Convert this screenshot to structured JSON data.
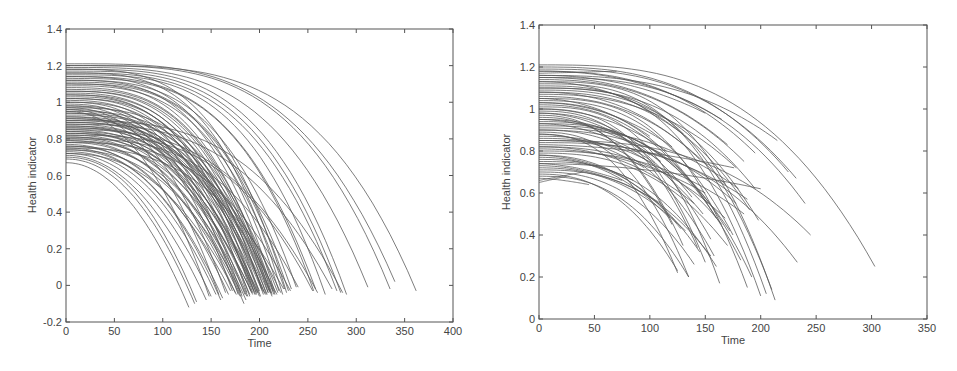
{
  "chart_data": [
    {
      "type": "line",
      "title": "",
      "xlabel": "Time",
      "ylabel": "Health indicator",
      "xlim": [
        0,
        400
      ],
      "ylim": [
        -0.2,
        1.4
      ],
      "xticks": [
        0,
        50,
        100,
        150,
        200,
        250,
        300,
        350,
        400
      ],
      "yticks": [
        -0.2,
        0,
        0.2,
        0.4,
        0.6,
        0.8,
        1,
        1.2,
        1.4
      ],
      "xtick_labels": [
        "0",
        "50",
        "100",
        "150",
        "200",
        "250",
        "300",
        "350",
        "400"
      ],
      "ytick_labels": [
        "-0.2",
        "0",
        "0.2",
        "0.4",
        "0.6",
        "0.8",
        "1",
        "1.2",
        "1.4"
      ],
      "grid": false,
      "legend": null,
      "description": "Many degradation trajectories (health indicator vs time), each starting between ~0.67 and ~1.21 at t=0 and decaying nonlinearly to ~0 to -0.12, failure times ranging ~125 to ~362",
      "curve_model": "h(t) = h0 - (h0 - hEnd) * (t / tEnd)^p",
      "series_params_columns": [
        "h0",
        "tEnd",
        "hEnd",
        "p"
      ],
      "series_params": [
        [
          0.67,
          127,
          -0.12,
          2.0
        ],
        [
          0.69,
          133,
          -0.1,
          2.1
        ],
        [
          0.7,
          135,
          -0.09,
          2.2
        ],
        [
          0.71,
          145,
          -0.08,
          2.1
        ],
        [
          0.72,
          150,
          -0.06,
          2.2
        ],
        [
          0.73,
          155,
          -0.05,
          2.3
        ],
        [
          0.74,
          160,
          -0.08,
          2.4
        ],
        [
          0.75,
          162,
          -0.07,
          2.3
        ],
        [
          0.76,
          168,
          -0.05,
          2.4
        ],
        [
          0.77,
          170,
          -0.03,
          2.2
        ],
        [
          0.78,
          175,
          -0.04,
          2.5
        ],
        [
          0.79,
          180,
          -0.06,
          2.4
        ],
        [
          0.8,
          184,
          -0.1,
          2.6
        ],
        [
          0.81,
          186,
          -0.08,
          2.5
        ],
        [
          0.82,
          188,
          -0.06,
          2.6
        ],
        [
          0.83,
          190,
          -0.05,
          2.7
        ],
        [
          0.84,
          192,
          -0.04,
          2.5
        ],
        [
          0.85,
          194,
          -0.03,
          2.6
        ],
        [
          0.86,
          196,
          -0.05,
          2.8
        ],
        [
          0.87,
          198,
          -0.04,
          2.6
        ],
        [
          0.88,
          200,
          -0.03,
          2.7
        ],
        [
          0.89,
          202,
          -0.02,
          2.8
        ],
        [
          0.9,
          205,
          -0.04,
          2.9
        ],
        [
          0.91,
          208,
          -0.05,
          2.7
        ],
        [
          0.92,
          210,
          -0.03,
          2.8
        ],
        [
          0.93,
          212,
          -0.04,
          3.0
        ],
        [
          0.94,
          215,
          -0.05,
          2.9
        ],
        [
          0.95,
          148,
          -0.06,
          2.2
        ],
        [
          0.96,
          158,
          -0.05,
          2.3
        ],
        [
          0.97,
          165,
          -0.04,
          2.4
        ],
        [
          0.98,
          172,
          -0.03,
          2.5
        ],
        [
          0.99,
          178,
          -0.05,
          2.6
        ],
        [
          1.0,
          182,
          -0.06,
          2.7
        ],
        [
          1.01,
          187,
          -0.04,
          2.8
        ],
        [
          1.02,
          191,
          -0.03,
          2.9
        ],
        [
          1.03,
          195,
          -0.05,
          3.0
        ],
        [
          1.04,
          199,
          -0.04,
          2.8
        ],
        [
          1.05,
          203,
          -0.03,
          2.9
        ],
        [
          1.06,
          207,
          -0.05,
          3.0
        ],
        [
          1.07,
          211,
          -0.04,
          3.1
        ],
        [
          1.08,
          214,
          -0.03,
          3.0
        ],
        [
          1.09,
          226,
          -0.02,
          3.1
        ],
        [
          1.1,
          230,
          -0.03,
          3.2
        ],
        [
          1.11,
          233,
          -0.02,
          3.1
        ],
        [
          1.12,
          238,
          -0.01,
          3.2
        ],
        [
          1.13,
          256,
          -0.03,
          3.3
        ],
        [
          1.14,
          258,
          -0.02,
          3.2
        ],
        [
          1.15,
          268,
          -0.05,
          3.4
        ],
        [
          1.16,
          280,
          -0.03,
          3.3
        ],
        [
          1.17,
          284,
          -0.04,
          3.4
        ],
        [
          1.18,
          290,
          -0.05,
          3.5
        ],
        [
          1.19,
          312,
          -0.01,
          3.4
        ],
        [
          1.2,
          335,
          -0.02,
          3.6
        ],
        [
          1.21,
          340,
          0.02,
          3.5
        ],
        [
          1.2,
          362,
          -0.03,
          3.7
        ],
        [
          0.85,
          260,
          -0.04,
          2.9
        ],
        [
          0.88,
          275,
          -0.02,
          3.0
        ],
        [
          0.9,
          286,
          -0.04,
          3.1
        ],
        [
          0.75,
          225,
          -0.02,
          2.8
        ],
        [
          0.78,
          232,
          -0.03,
          2.9
        ],
        [
          0.8,
          240,
          -0.01,
          3.0
        ],
        [
          0.82,
          255,
          -0.03,
          3.1
        ],
        [
          0.84,
          218,
          -0.05,
          2.7
        ],
        [
          0.86,
          222,
          -0.04,
          2.8
        ],
        [
          0.92,
          180,
          -0.04,
          2.6
        ],
        [
          0.94,
          185,
          -0.05,
          2.6
        ],
        [
          0.96,
          190,
          -0.06,
          2.7
        ],
        [
          0.98,
          193,
          -0.04,
          2.8
        ],
        [
          1.0,
          197,
          -0.05,
          2.9
        ],
        [
          1.02,
          201,
          -0.06,
          3.0
        ],
        [
          1.04,
          204,
          -0.05,
          3.0
        ],
        [
          1.06,
          209,
          -0.04,
          3.1
        ],
        [
          1.1,
          213,
          -0.05,
          3.1
        ],
        [
          1.12,
          216,
          -0.04,
          3.2
        ],
        [
          1.14,
          220,
          -0.03,
          3.2
        ],
        [
          1.16,
          224,
          -0.05,
          3.3
        ],
        [
          1.18,
          228,
          -0.04,
          3.3
        ],
        [
          0.72,
          176,
          -0.05,
          2.4
        ],
        [
          0.74,
          181,
          -0.04,
          2.5
        ],
        [
          0.76,
          187,
          -0.06,
          2.6
        ],
        [
          0.79,
          193,
          -0.05,
          2.6
        ],
        [
          0.81,
          197,
          -0.04,
          2.7
        ],
        [
          0.83,
          200,
          -0.06,
          2.8
        ],
        [
          0.87,
          206,
          -0.05,
          2.8
        ],
        [
          0.89,
          209,
          -0.04,
          2.9
        ],
        [
          0.91,
          213,
          -0.06,
          2.9
        ],
        [
          0.95,
          216,
          -0.05,
          3.0
        ],
        [
          0.97,
          219,
          -0.04,
          3.0
        ]
      ]
    },
    {
      "type": "line",
      "title": "",
      "xlabel": "Time",
      "ylabel": "Health indicator",
      "xlim": [
        0,
        350
      ],
      "ylim": [
        0,
        1.4
      ],
      "xticks": [
        0,
        50,
        100,
        150,
        200,
        250,
        300,
        350
      ],
      "yticks": [
        0,
        0.2,
        0.4,
        0.6,
        0.8,
        1,
        1.2,
        1.4
      ],
      "xtick_labels": [
        "0",
        "50",
        "100",
        "150",
        "200",
        "250",
        "300",
        "350"
      ],
      "ytick_labels": [
        "0",
        "0.2",
        "0.4",
        "0.6",
        "0.8",
        "1",
        "1.2",
        "1.4"
      ],
      "grid": false,
      "legend": null,
      "description": "Truncated degradation trajectories (health indicator vs time), starting ~0.65 to ~1.21 at t=0, ending at various times (~40 to ~303) and health levels (~0.08 to ~1.18)",
      "curve_model": "h(t) = h0 - (h0 - hEnd) * (t / tEnd)^p",
      "series_params_columns": [
        "h0",
        "tEnd",
        "hEnd",
        "p"
      ],
      "series_params": [
        [
          1.21,
          303,
          0.25,
          3.0
        ],
        [
          1.19,
          232,
          0.67,
          2.8
        ],
        [
          1.18,
          195,
          0.79,
          2.6
        ],
        [
          1.17,
          70,
          1.18,
          1.0
        ],
        [
          1.16,
          215,
          0.85,
          2.7
        ],
        [
          1.15,
          170,
          0.83,
          2.4
        ],
        [
          1.14,
          185,
          0.75,
          2.5
        ],
        [
          1.13,
          213,
          0.09,
          3.2
        ],
        [
          1.12,
          205,
          0.12,
          3.1
        ],
        [
          1.11,
          200,
          0.11,
          3.0
        ],
        [
          1.1,
          210,
          0.14,
          3.1
        ],
        [
          1.09,
          198,
          0.47,
          2.8
        ],
        [
          1.08,
          190,
          0.52,
          2.7
        ],
        [
          1.07,
          178,
          0.72,
          2.5
        ],
        [
          1.06,
          168,
          0.64,
          2.4
        ],
        [
          1.05,
          188,
          0.15,
          3.0
        ],
        [
          1.04,
          175,
          0.4,
          2.7
        ],
        [
          1.03,
          160,
          0.48,
          2.5
        ],
        [
          1.02,
          152,
          0.55,
          2.4
        ],
        [
          1.01,
          163,
          0.17,
          2.9
        ],
        [
          1.0,
          150,
          0.27,
          2.7
        ],
        [
          0.99,
          143,
          0.34,
          2.6
        ],
        [
          0.98,
          138,
          0.58,
          2.3
        ],
        [
          0.97,
          120,
          0.45,
          2.4
        ],
        [
          0.96,
          130,
          0.35,
          2.5
        ],
        [
          0.95,
          155,
          0.38,
          2.6
        ],
        [
          0.94,
          172,
          0.42,
          2.6
        ],
        [
          0.93,
          182,
          0.28,
          2.9
        ],
        [
          0.92,
          192,
          0.2,
          3.0
        ],
        [
          0.91,
          180,
          0.62,
          2.4
        ],
        [
          0.9,
          148,
          0.5,
          2.4
        ],
        [
          0.89,
          135,
          0.2,
          2.6
        ],
        [
          0.88,
          125,
          0.22,
          2.5
        ],
        [
          0.87,
          158,
          0.3,
          2.7
        ],
        [
          0.86,
          165,
          0.45,
          2.6
        ],
        [
          0.85,
          245,
          0.4,
          2.9
        ],
        [
          0.84,
          233,
          0.27,
          2.9
        ],
        [
          0.83,
          176,
          0.72,
          1.8
        ],
        [
          0.82,
          140,
          0.55,
          2.2
        ],
        [
          0.81,
          150,
          0.6,
          2.1
        ],
        [
          0.8,
          185,
          0.5,
          2.5
        ],
        [
          0.79,
          170,
          0.35,
          2.6
        ],
        [
          0.78,
          128,
          0.43,
          2.3
        ],
        [
          0.77,
          118,
          0.48,
          2.2
        ],
        [
          0.76,
          145,
          0.32,
          2.5
        ],
        [
          0.75,
          160,
          0.25,
          2.7
        ],
        [
          0.74,
          200,
          0.62,
          1.9
        ],
        [
          0.73,
          110,
          0.55,
          2.0
        ],
        [
          0.72,
          132,
          0.42,
          2.3
        ],
        [
          0.71,
          155,
          0.3,
          2.6
        ],
        [
          0.7,
          140,
          0.26,
          2.5
        ],
        [
          0.69,
          125,
          0.23,
          2.4
        ],
        [
          0.68,
          135,
          0.2,
          2.5
        ],
        [
          0.67,
          45,
          0.64,
          1.5
        ],
        [
          0.66,
          40,
          0.7,
          1.0
        ],
        [
          0.65,
          25,
          0.68,
          1.0
        ],
        [
          1.2,
          225,
          0.7,
          2.8
        ],
        [
          1.15,
          240,
          0.55,
          2.9
        ],
        [
          1.1,
          195,
          0.62,
          2.7
        ],
        [
          1.05,
          100,
          0.87,
          2.0
        ],
        [
          1.0,
          115,
          0.8,
          2.1
        ],
        [
          0.95,
          110,
          0.75,
          2.0
        ],
        [
          0.9,
          178,
          0.55,
          2.4
        ],
        [
          0.85,
          188,
          0.57,
          2.4
        ],
        [
          0.82,
          168,
          0.48,
          2.5
        ],
        [
          1.13,
          130,
          0.88,
          2.2
        ],
        [
          1.08,
          145,
          0.76,
          2.3
        ],
        [
          1.03,
          120,
          0.82,
          2.1
        ],
        [
          0.98,
          100,
          0.78,
          2.0
        ],
        [
          0.93,
          105,
          0.74,
          2.0
        ],
        [
          0.88,
          95,
          0.72,
          1.9
        ],
        [
          0.78,
          85,
          0.66,
          1.8
        ],
        [
          0.74,
          75,
          0.66,
          1.7
        ],
        [
          1.18,
          165,
          0.95,
          2.3
        ],
        [
          1.16,
          150,
          0.98,
          2.2
        ]
      ]
    }
  ],
  "charts": {
    "left": {
      "xlabel": "Time",
      "ylabel": "Health indicator"
    },
    "right": {
      "xlabel": "Time",
      "ylabel": "Health indicator"
    }
  }
}
